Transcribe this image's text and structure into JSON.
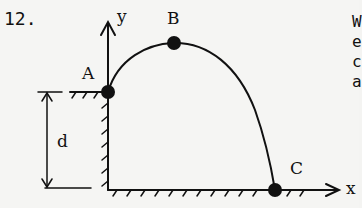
{
  "problem": {
    "number": "12."
  },
  "figure": {
    "axis_labels": {
      "x": "x",
      "y": "y"
    },
    "points": [
      {
        "label": "A",
        "role": "launch point on top of ledge"
      },
      {
        "label": "B",
        "role": "apex of trajectory"
      },
      {
        "label": "C",
        "role": "landing point on ground"
      }
    ],
    "dimension_label": "d",
    "colors": {
      "ink": "#111111",
      "paper": "#f5f5f3"
    }
  },
  "clipped_text": {
    "lines": [
      "W",
      "e",
      "c",
      "a"
    ]
  }
}
